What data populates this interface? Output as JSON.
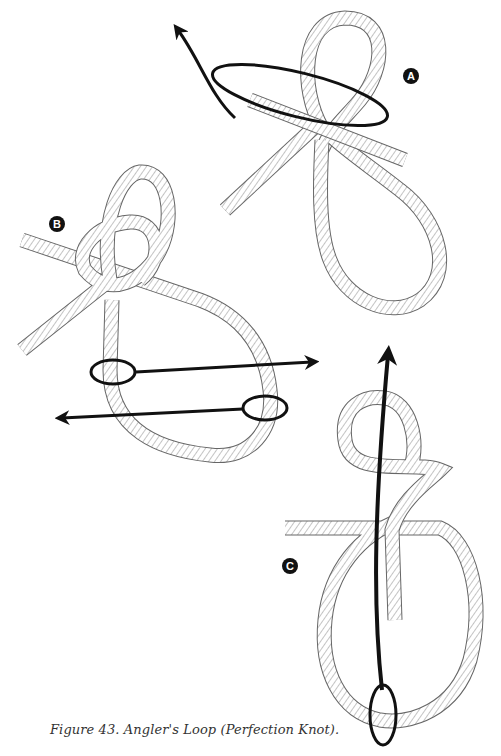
{
  "figure": {
    "caption": "Figure 43. Angler's Loop (Perfection Knot).",
    "steps": [
      {
        "label": "A",
        "description": "Form a loop, then wrap the working end around behind it"
      },
      {
        "label": "B",
        "description": "Pull the second loop through the first; pull in opposite directions"
      },
      {
        "label": "C",
        "description": "Pull the lower loop up through the knot to tighten"
      }
    ],
    "colors": {
      "rope_outline": "#555555",
      "rope_fill": "#ffffff",
      "hatch": "#777777",
      "arrow": "#111111",
      "badge": "#111111"
    }
  }
}
